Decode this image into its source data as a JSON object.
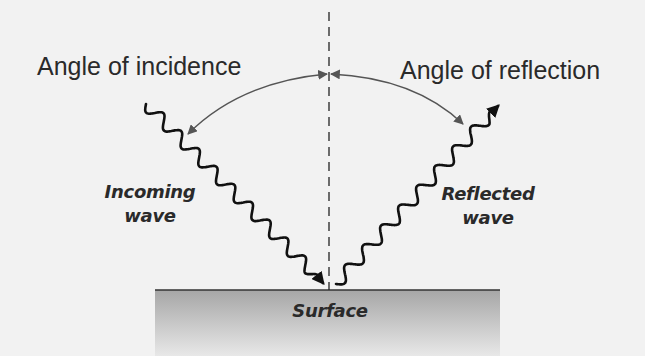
{
  "diagram": {
    "labels": {
      "angle_incidence": "Angle of incidence",
      "angle_reflection": "Angle of reflection",
      "incoming_wave_line1": "Incoming",
      "incoming_wave_line2": "wave",
      "reflected_wave_line1": "Reflected",
      "reflected_wave_line2": "wave",
      "surface": "Surface"
    },
    "colors": {
      "background": "#f2f2f2",
      "ink": "#111111",
      "arc": "#555555",
      "surface_top": "#a9a9a9",
      "surface_bottom": "#e6e6e6"
    }
  }
}
